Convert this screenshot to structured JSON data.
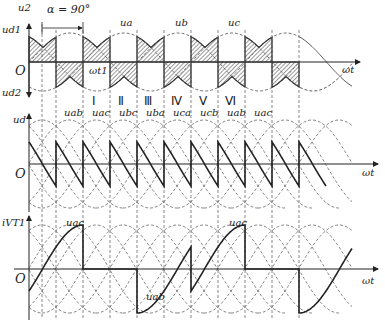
{
  "top_panel": {
    "y_axis_label": "u2",
    "upper_label": "ud1",
    "lower_label": "ud2",
    "origin_label": "O",
    "x_axis_label": "ωt",
    "wt1_label": "ωt1",
    "alpha_label": "α = 90°",
    "phase_labels": [
      "ua",
      "ub",
      "uc"
    ]
  },
  "intervals": [
    "Ⅰ",
    "Ⅱ",
    "Ⅲ",
    "Ⅳ",
    "Ⅴ",
    "Ⅵ"
  ],
  "middle_panel": {
    "y_axis_label": "ud",
    "origin_label": "O",
    "x_axis_label": "ωt",
    "line_voltage_labels": [
      "uab",
      "uac",
      "ubc",
      "uba",
      "uca",
      "ucb",
      "uab",
      "uac"
    ]
  },
  "bottom_panel": {
    "y_axis_label": "iVT1",
    "origin_label": "O",
    "x_axis_label": "ωt",
    "curve_labels": [
      "uac",
      "uab",
      "uac"
    ]
  },
  "colors": {
    "stroke": "#222222",
    "dashed": "#555555",
    "hatch": "#333333"
  }
}
